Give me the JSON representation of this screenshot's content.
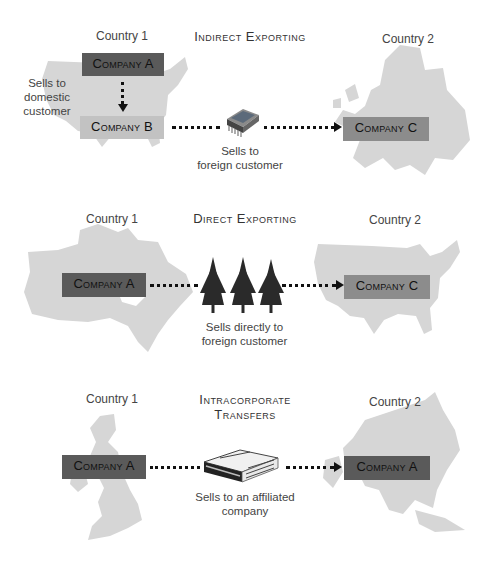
{
  "sections": [
    {
      "title": "Indirect Exporting",
      "country1": "Country 1",
      "country2": "Country 2",
      "company_a": "Company A",
      "company_b": "Company B",
      "company_c": "Company C",
      "side_caption": [
        "Sells to",
        "domestic",
        "customer"
      ],
      "caption": [
        "Sells to",
        "foreign customer"
      ],
      "product_icon": "microchip-icon",
      "map1": "usa-map",
      "map2": "europe-map"
    },
    {
      "title": "Direct Exporting",
      "country1": "Country 1",
      "country2": "Country 2",
      "company_a": "Company A",
      "company_c": "Company C",
      "caption": [
        "Sells directly to",
        "foreign customer"
      ],
      "product_icon": "pine-trees-icon",
      "map1": "canada-map",
      "map2": "usa-map"
    },
    {
      "title": "Intracorporate Transfers",
      "country1": "Country 1",
      "country2": "Country 2",
      "company_a": "Company A",
      "company_a2": "Company A",
      "caption": [
        "Sells to an affiliated",
        "company"
      ],
      "product_icon": "newspaper-icon",
      "map1": "uk-map",
      "map2": "asia-map"
    }
  ],
  "colors": {
    "dark_box": "#5a5a5a",
    "light_box": "#c2c2c2",
    "mid_box": "#8c8c8c",
    "map_fill": "#d6d6d6",
    "arrow": "#111111"
  }
}
